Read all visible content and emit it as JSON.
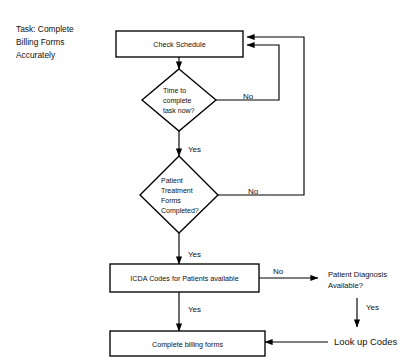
{
  "diagram": {
    "title_lines": [
      "Task:  Complete",
      "Billing Forms",
      "Accurately"
    ],
    "nodes": {
      "check_schedule": "Check Schedule",
      "time_decision_lines": [
        "Time to",
        "complete",
        "task now?"
      ],
      "forms_decision_lines": [
        "Patient",
        "Treatment",
        "Forms",
        "Completed?"
      ],
      "icda_box": "ICDA Codes for Patients available",
      "complete_billing": "Complete billing forms",
      "diagnosis_lines": [
        "Patient Diagnosis",
        "Available?"
      ],
      "look_up_codes": "Look up Codes"
    },
    "edge_labels": {
      "time_no": "No",
      "time_yes": "Yes",
      "forms_no": "No",
      "forms_yes": "Yes",
      "icda_no": "No",
      "icda_yes": "Yes",
      "diagnosis_yes": "Yes"
    },
    "colors": {
      "stroke": "#000000",
      "fill": "#ffffff",
      "text": "#111111"
    }
  }
}
